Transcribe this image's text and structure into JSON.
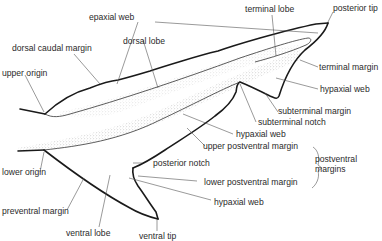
{
  "diagram": {
    "labels": {
      "epaxial_web": "epaxial web",
      "dorsal_lobe": "dorsal lobe",
      "dorsal_caudal_margin": "dorsal caudal margin",
      "upper_origin": "upper origin",
      "terminal_lobe": "terminal lobe",
      "posterior_tip": "posterior tip",
      "terminal_margin": "terminal margin",
      "hypaxial_web_upper": "hypaxial web",
      "subterminal_margin": "subterminal margin",
      "subterminal_notch": "subterminal notch",
      "hypaxial_web_mid": "hypaxial web",
      "upper_postventral_margin": "upper postventral margin",
      "postventral_margins_line1": "postventral",
      "postventral_margins_line2": "margins",
      "posterior_notch": "posterior notch",
      "lower_postventral_margin": "lower postventral margin",
      "lower_origin": "lower origin",
      "hypaxial_web_lower": "hypaxial web",
      "preventral_margin": "preventral margin",
      "ventral_lobe": "ventral lobe",
      "ventral_tip": "ventral tip"
    },
    "colors": {
      "outline": "#1a1a1a",
      "leader": "#555555",
      "text": "#2a2a2a",
      "stipple": "#bdbdbd"
    }
  }
}
